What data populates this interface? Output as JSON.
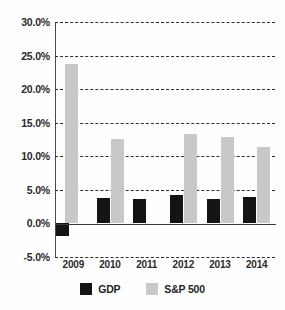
{
  "chart_data": {
    "type": "bar",
    "title": "",
    "xlabel": "",
    "ylabel": "",
    "categories": [
      "2009",
      "2010",
      "2011",
      "2012",
      "2013",
      "2014"
    ],
    "series": [
      {
        "name": "GDP",
        "color": "#141414",
        "values": [
          -1.8,
          3.8,
          3.7,
          4.2,
          3.7,
          3.9
        ]
      },
      {
        "name": "S&P 500",
        "color": "#c8c8c8",
        "values": [
          23.7,
          12.6,
          0.0,
          13.3,
          12.9,
          11.4
        ]
      }
    ],
    "ylim": [
      -5.0,
      30.0
    ],
    "ytick_values": [
      30.0,
      25.0,
      20.0,
      15.0,
      10.0,
      5.0,
      0.0,
      -5.0
    ],
    "ytick_labels": [
      "30.0%",
      "25.0%",
      "20.0%",
      "15.0%",
      "10.0%",
      "5.0%",
      "0.0%",
      "-5.0%"
    ],
    "grid": "horizontal-dashed",
    "legend_position": "bottom-center"
  },
  "legend": {
    "items": [
      {
        "label": "GDP",
        "color": "#141414"
      },
      {
        "label": "S&P 500",
        "color": "#c8c8c8"
      }
    ]
  },
  "colors": {
    "gdp": "#141414",
    "snp": "#c8c8c8",
    "axis": "#3a3a3a",
    "grid": "#2f2f2f",
    "background": "#ffffff",
    "text": "#2a2a2a"
  }
}
